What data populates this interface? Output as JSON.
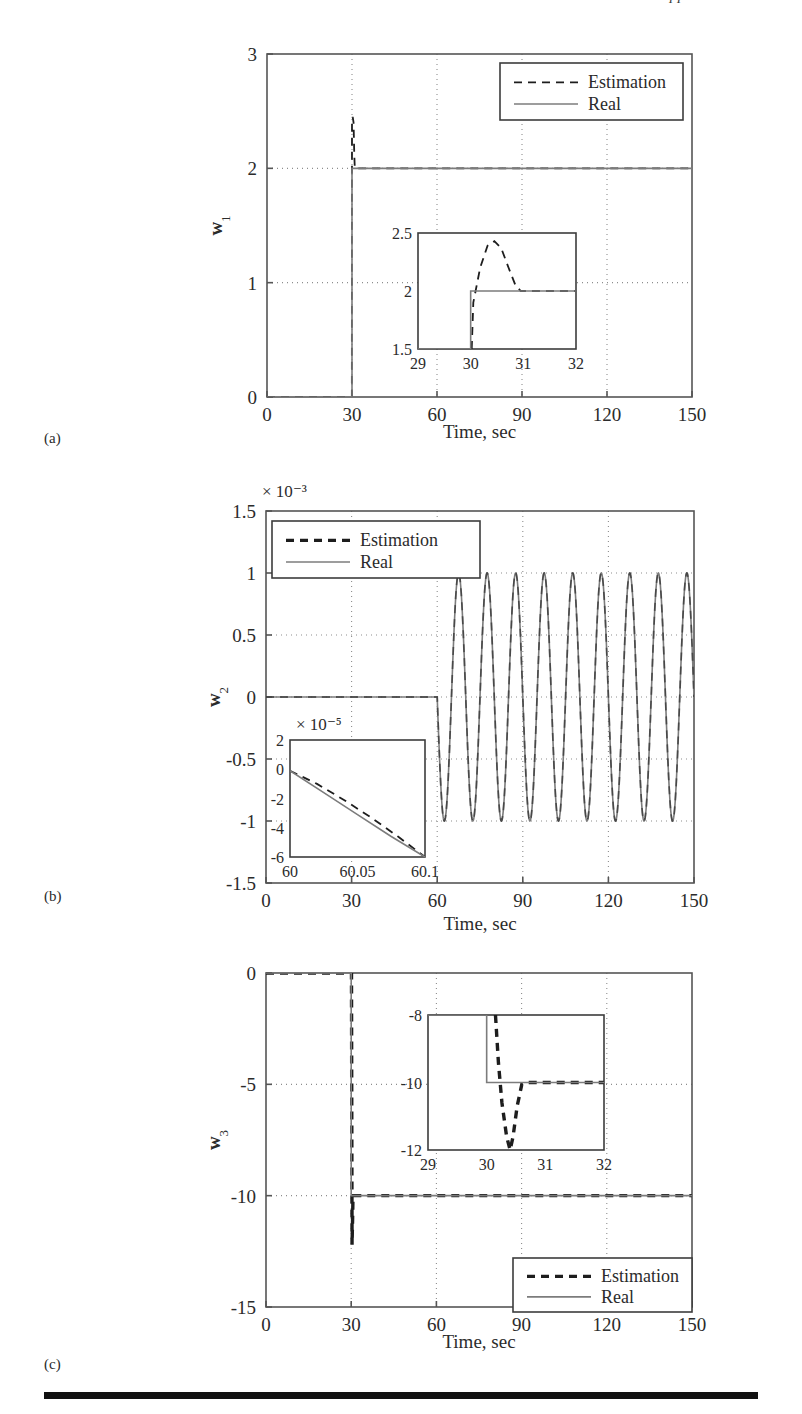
{
  "page": {
    "header_text": "Applications",
    "panel_labels": {
      "a": "(a)",
      "b": "(b)",
      "c": "(c)"
    }
  },
  "legend": {
    "estimation": "Estimation",
    "real": "Real"
  },
  "axis_titles": {
    "time": "Time, sec",
    "w1": "w",
    "w1_sub": "1",
    "w2": "w",
    "w2_sub": "2",
    "w3": "w",
    "w3_sub": "3"
  },
  "colors": {
    "real_line": "#7c7c7c",
    "estimation_line": "#1d1d1d",
    "axis": "#555555",
    "grid": "#8d8d8d",
    "rule": "#111111"
  },
  "chart_data": [
    {
      "id": "panel-a",
      "type": "line",
      "title": "",
      "xlabel": "Time, sec",
      "ylabel": "w1",
      "xlim": [
        0,
        150
      ],
      "ylim": [
        0,
        3
      ],
      "xticks": [
        0,
        30,
        60,
        90,
        120,
        150
      ],
      "xticklabels": [
        "0",
        "30",
        "60",
        "90",
        "120",
        "150"
      ],
      "yticks": [
        0,
        1,
        2,
        3
      ],
      "yticklabels": [
        "0",
        "1",
        "2",
        "3"
      ],
      "grid": true,
      "legend_position": "top-right",
      "series": [
        {
          "name": "Estimation",
          "style": "dashed",
          "points": [
            [
              0,
              0
            ],
            [
              29.95,
              0
            ],
            [
              30.0,
              2.42
            ],
            [
              30.25,
              2.45
            ],
            [
              30.55,
              2.4
            ],
            [
              30.8,
              2.12
            ],
            [
              31.0,
              2.0
            ],
            [
              40,
              2.0
            ],
            [
              150,
              2.0
            ]
          ]
        },
        {
          "name": "Real",
          "style": "solid",
          "points": [
            [
              0,
              0
            ],
            [
              30,
              0
            ],
            [
              30,
              2.0
            ],
            [
              150,
              2.0
            ]
          ]
        }
      ],
      "inset": {
        "xlim": [
          29,
          32
        ],
        "ylim": [
          1.5,
          2.5
        ],
        "xticks": [
          29,
          30,
          31,
          32
        ],
        "xticklabels": [
          "29",
          "30",
          "31",
          "32"
        ],
        "yticks": [
          1.5,
          2,
          2.5
        ],
        "yticklabels": [
          "1.5",
          "2",
          "2.5"
        ],
        "series": [
          {
            "name": "Estimation",
            "style": "dashed",
            "points": [
              [
                30.02,
                1.5
              ],
              [
                30.05,
                1.9
              ],
              [
                30.18,
                2.2
              ],
              [
                30.32,
                2.39
              ],
              [
                30.45,
                2.43
              ],
              [
                30.58,
                2.37
              ],
              [
                30.72,
                2.2
              ],
              [
                30.85,
                2.05
              ],
              [
                30.95,
                2.0
              ],
              [
                32,
                2.0
              ]
            ]
          },
          {
            "name": "Real",
            "style": "solid",
            "points": [
              [
                29,
                1.5
              ],
              [
                30,
                1.5
              ],
              [
                30,
                2.0
              ],
              [
                32,
                2.0
              ]
            ]
          }
        ]
      }
    },
    {
      "id": "panel-b",
      "type": "line",
      "title": "",
      "xlabel": "Time, sec",
      "ylabel": "w2",
      "exponent_label": "× 10⁻³",
      "xlim": [
        0,
        150
      ],
      "ylim": [
        -1.5,
        1.5
      ],
      "xticks": [
        0,
        30,
        60,
        90,
        120,
        150
      ],
      "xticklabels": [
        "0",
        "30",
        "60",
        "90",
        "120",
        "150"
      ],
      "yticks": [
        -1.5,
        -1,
        -0.5,
        0,
        0.5,
        1,
        1.5
      ],
      "yticklabels": [
        "-1.5",
        "-1",
        "-0.5",
        "0",
        "0.5",
        "1",
        "1.5"
      ],
      "grid": true,
      "legend_position": "top-left",
      "oscillation": {
        "start_time": 60,
        "end_time": 150,
        "amplitude": 1.0,
        "period": 10.0,
        "cycles": 9
      },
      "series": [
        {
          "name": "Estimation",
          "style": "dashed",
          "description": "overlaps Real"
        },
        {
          "name": "Real",
          "style": "solid",
          "description": "zero until t=60, then sinusoid amplitude 1e-3, period 10 s"
        }
      ],
      "inset": {
        "xlim": [
          60,
          60.1
        ],
        "ylim": [
          -6,
          2
        ],
        "exponent_label": "× 10⁻⁵",
        "xticks": [
          60,
          60.05,
          60.1
        ],
        "xticklabels": [
          "60",
          "60.05",
          "60.1"
        ],
        "yticks": [
          -6,
          -4,
          -2,
          0,
          2
        ],
        "yticklabels": [
          "-6",
          "-4",
          "-2",
          "0",
          "2"
        ],
        "series": [
          {
            "name": "Estimation",
            "style": "dashed",
            "points": [
              [
                60,
                -0.1
              ],
              [
                60.02,
                -1.0
              ],
              [
                60.04,
                -2.1
              ],
              [
                60.06,
                -3.3
              ],
              [
                60.08,
                -4.6
              ],
              [
                60.1,
                -6.0
              ]
            ]
          },
          {
            "name": "Real",
            "style": "solid",
            "points": [
              [
                60,
                -0.1
              ],
              [
                60.025,
                -1.6
              ],
              [
                60.05,
                -3.1
              ],
              [
                60.075,
                -4.6
              ],
              [
                60.1,
                -6.0
              ]
            ]
          }
        ]
      }
    },
    {
      "id": "panel-c",
      "type": "line",
      "title": "",
      "xlabel": "Time, sec",
      "ylabel": "w3",
      "xlim": [
        0,
        150
      ],
      "ylim": [
        -15,
        0
      ],
      "xticks": [
        0,
        30,
        60,
        90,
        120,
        150
      ],
      "xticklabels": [
        "0",
        "30",
        "60",
        "90",
        "120",
        "150"
      ],
      "yticks": [
        -15,
        -10,
        -5,
        0
      ],
      "yticklabels": [
        "-15",
        "-10",
        "-5",
        "0"
      ],
      "grid": true,
      "legend_position": "bottom-right",
      "series": [
        {
          "name": "Estimation",
          "style": "dashed",
          "points": [
            [
              0,
              0
            ],
            [
              30.1,
              0
            ],
            [
              30.3,
              -12.2
            ],
            [
              30.5,
              -11.0
            ],
            [
              30.62,
              -10.1
            ],
            [
              30.8,
              -10.0
            ],
            [
              150,
              -10.0
            ]
          ]
        },
        {
          "name": "Real",
          "style": "solid",
          "points": [
            [
              0,
              0
            ],
            [
              30,
              0
            ],
            [
              30,
              -10.0
            ],
            [
              150,
              -10.0
            ]
          ]
        }
      ],
      "inset": {
        "xlim": [
          29,
          32
        ],
        "ylim": [
          -12,
          -8
        ],
        "xticks": [
          29,
          30,
          31,
          32
        ],
        "xticklabels": [
          "29",
          "30",
          "31",
          "32"
        ],
        "yticks": [
          -12,
          -10,
          -8
        ],
        "yticklabels": [
          "-12",
          "-10",
          "-8"
        ],
        "series": [
          {
            "name": "Estimation",
            "style": "dashed",
            "points": [
              [
                30.15,
                -8
              ],
              [
                30.2,
                -9.4
              ],
              [
                30.26,
                -10.6
              ],
              [
                30.34,
                -11.6
              ],
              [
                30.4,
                -12
              ],
              [
                30.45,
                -11.6
              ],
              [
                30.52,
                -10.7
              ],
              [
                30.6,
                -10.05
              ],
              [
                30.7,
                -10.0
              ],
              [
                32,
                -10.0
              ]
            ]
          },
          {
            "name": "Real",
            "style": "solid",
            "points": [
              [
                29,
                -8
              ],
              [
                30,
                -8
              ],
              [
                30,
                -10.0
              ],
              [
                32,
                -10.0
              ]
            ]
          }
        ]
      }
    }
  ]
}
